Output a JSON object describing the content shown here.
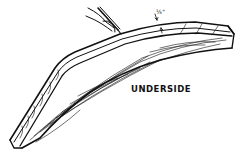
{
  "diagram": {
    "labels": {
      "underside": "UNDERSIDE",
      "dimension": "⅛\""
    },
    "elements": [
      {
        "name": "curved-board",
        "description": "laminated curved wood piece with grain lines"
      },
      {
        "name": "hand-with-pencil",
        "description": "hand holding pencil marking the top edge"
      },
      {
        "name": "dimension-arrows",
        "description": "arrows indicating 1/8 inch offset from edge"
      }
    ],
    "colors": {
      "line": "#111111",
      "background": "#ffffff"
    }
  }
}
